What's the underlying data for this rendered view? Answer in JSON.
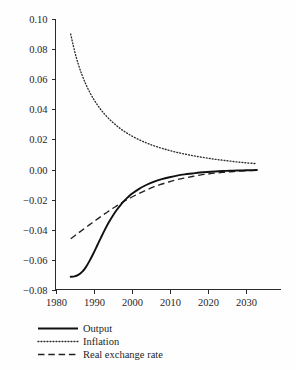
{
  "chart_data": {
    "type": "line",
    "title": "",
    "subtitle": "",
    "xlabel": "",
    "ylabel": "",
    "xlim": [
      1980,
      2034
    ],
    "ylim": [
      -0.08,
      0.1
    ],
    "grid": false,
    "legend_position": "below-left",
    "xticks": [
      "1980",
      "1990",
      "2000",
      "2010",
      "2020",
      "2030"
    ],
    "xtick_values": [
      1980,
      1990,
      2000,
      2010,
      2020,
      2030
    ],
    "yticks": [
      "0.10",
      "0.08",
      "0.06",
      "0.04",
      "0.02",
      "0.00",
      "-0.02",
      "-0.04",
      "-0.06",
      "-0.08"
    ],
    "ytick_values": [
      0.1,
      0.08,
      0.06,
      0.04,
      0.02,
      0.0,
      -0.02,
      -0.04,
      -0.06,
      -0.08
    ],
    "x": [
      1984,
      1985,
      1986,
      1987,
      1988,
      1989,
      1990,
      1991,
      1992,
      1993,
      1994,
      1995,
      1996,
      1997,
      1998,
      1999,
      2000,
      2002,
      2004,
      2006,
      2008,
      2010,
      2012,
      2014,
      2016,
      2018,
      2020,
      2022,
      2024,
      2026,
      2028,
      2030,
      2032,
      2033
    ],
    "series": [
      {
        "name": "Output",
        "style": "solid",
        "values": [
          -0.0712,
          -0.071,
          -0.07,
          -0.068,
          -0.0648,
          -0.0605,
          -0.0556,
          -0.0503,
          -0.045,
          -0.0399,
          -0.0352,
          -0.031,
          -0.0272,
          -0.0239,
          -0.021,
          -0.0185,
          -0.0163,
          -0.0128,
          -0.0101,
          -0.008,
          -0.0064,
          -0.0051,
          -0.004,
          -0.0032,
          -0.0026,
          -0.002,
          -0.0016,
          -0.0013,
          -0.001,
          -0.0008,
          -0.0006,
          -0.0005,
          -0.0004,
          -0.0003
        ]
      },
      {
        "name": "Inflation",
        "style": "dotted",
        "values": [
          0.09,
          0.079,
          0.07,
          0.0627,
          0.0566,
          0.0514,
          0.0469,
          0.043,
          0.0396,
          0.0366,
          0.0339,
          0.0315,
          0.0293,
          0.0273,
          0.0255,
          0.0239,
          0.0224,
          0.0198,
          0.0176,
          0.0157,
          0.0141,
          0.0127,
          0.0114,
          0.0103,
          0.0093,
          0.0084,
          0.0076,
          0.0068,
          0.0062,
          0.0056,
          0.005,
          0.0045,
          0.0041,
          0.0039
        ]
      },
      {
        "name": "Real exchange rate",
        "style": "dashed",
        "values": [
          -0.046,
          -0.0441,
          -0.0422,
          -0.0403,
          -0.0384,
          -0.0366,
          -0.0347,
          -0.0329,
          -0.0311,
          -0.0293,
          -0.0276,
          -0.0259,
          -0.0243,
          -0.0227,
          -0.0212,
          -0.0198,
          -0.0184,
          -0.0158,
          -0.0135,
          -0.0114,
          -0.0096,
          -0.0081,
          -0.0067,
          -0.0056,
          -0.0046,
          -0.0037,
          -0.003,
          -0.0024,
          -0.0019,
          -0.0015,
          -0.0011,
          -0.0008,
          -0.0006,
          -0.0005
        ]
      }
    ],
    "legend": [
      {
        "label": "Output",
        "style": "solid"
      },
      {
        "label": "Inflation",
        "style": "dotted"
      },
      {
        "label": "Real exchange rate",
        "style": "dashed"
      }
    ],
    "colors": {
      "output": "#111111",
      "inflation": "#2b2b2b",
      "real_exchange_rate": "#222222",
      "axis": "#2a2a2a",
      "background": "#fefefe"
    }
  }
}
